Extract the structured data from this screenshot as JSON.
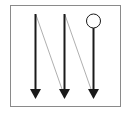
{
  "icon": {
    "name": "scan-order-icon",
    "frame_color": "#8a8a8a",
    "line_color": "#1a1a1a",
    "diagonal_color": "#9a9a9a",
    "columns": 3,
    "start_marker": "circle"
  }
}
